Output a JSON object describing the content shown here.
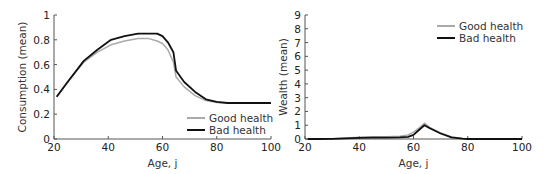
{
  "chart_data": [
    {
      "type": "line",
      "title": "",
      "xlabel": "Age, j",
      "ylabel": "Consumption (mean)",
      "xlim": [
        20,
        100
      ],
      "ylim": [
        0,
        1
      ],
      "xticks": [
        "20",
        "40",
        "60",
        "80",
        "100"
      ],
      "yticks": [
        "0",
        "0.2",
        "0.4",
        "0.6",
        "0.8",
        "1"
      ],
      "grid": false,
      "legend_position": "lower right",
      "x": [
        21,
        25,
        31,
        36,
        41,
        46,
        51,
        55,
        58,
        60,
        62,
        64,
        65,
        68,
        72,
        76,
        80,
        84,
        90,
        100
      ],
      "series": [
        {
          "name": "Good health",
          "color": "#aaaaaa",
          "values": [
            0.34,
            0.46,
            0.62,
            0.7,
            0.76,
            0.79,
            0.81,
            0.81,
            0.79,
            0.77,
            0.72,
            0.62,
            0.5,
            0.42,
            0.35,
            0.31,
            0.295,
            0.29,
            0.29,
            0.29
          ]
        },
        {
          "name": "Bad health",
          "color": "#111111",
          "values": [
            0.34,
            0.46,
            0.63,
            0.72,
            0.8,
            0.83,
            0.85,
            0.85,
            0.85,
            0.83,
            0.78,
            0.7,
            0.55,
            0.46,
            0.38,
            0.32,
            0.3,
            0.29,
            0.29,
            0.29
          ]
        }
      ]
    },
    {
      "type": "line",
      "title": "",
      "xlabel": "Age, j",
      "ylabel": "Wealth (mean)",
      "xlim": [
        20,
        100
      ],
      "ylim": [
        0,
        9
      ],
      "xticks": [
        "20",
        "40",
        "60",
        "80",
        "100"
      ],
      "yticks": [
        "0",
        "1",
        "2",
        "3",
        "4",
        "5",
        "6",
        "7",
        "8",
        "9"
      ],
      "grid": false,
      "legend_position": "upper right",
      "x": [
        21,
        25,
        30,
        35,
        40,
        45,
        50,
        55,
        58,
        60,
        62,
        64,
        66,
        70,
        74,
        78,
        80,
        85,
        100
      ],
      "series": [
        {
          "name": "Good health",
          "color": "#aaaaaa",
          "values": [
            0.0,
            0.0,
            0.02,
            0.08,
            0.12,
            0.16,
            0.17,
            0.2,
            0.3,
            0.5,
            0.8,
            1.15,
            0.85,
            0.45,
            0.15,
            0.03,
            0.0,
            0.0,
            0.0
          ]
        },
        {
          "name": "Bad health",
          "color": "#111111",
          "values": [
            0.0,
            0.0,
            0.01,
            0.05,
            0.08,
            0.1,
            0.1,
            0.12,
            0.15,
            0.3,
            0.65,
            1.0,
            0.78,
            0.4,
            0.12,
            0.02,
            0.0,
            0.0,
            0.0
          ]
        }
      ]
    }
  ]
}
